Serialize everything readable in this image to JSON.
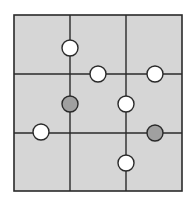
{
  "diagram": {
    "type": "grid-puzzle",
    "rows": 3,
    "cols": 3,
    "colors": {
      "background": "#ffffff",
      "cell_fill": "#d6d6d6",
      "line": "#2a2a2a",
      "white_circle": "#ffffff",
      "gray_circle": "#a0a0a0"
    },
    "frame": {
      "x": 14,
      "y": 15,
      "width": 168,
      "height": 176
    },
    "vertical_lines": [
      {
        "x": 70,
        "y1": 15,
        "y2": 191
      },
      {
        "x": 126,
        "y1": 15,
        "y2": 191
      }
    ],
    "horizontal_lines": [
      {
        "y": 74,
        "x1": 14,
        "x2": 182
      },
      {
        "y": 133,
        "x1": 14,
        "x2": 182
      }
    ],
    "circles": [
      {
        "cx": 70,
        "cy": 48,
        "r": 8,
        "color": "white"
      },
      {
        "cx": 98,
        "cy": 74,
        "r": 8,
        "color": "white"
      },
      {
        "cx": 155,
        "cy": 74,
        "r": 8,
        "color": "white"
      },
      {
        "cx": 70,
        "cy": 104,
        "r": 8,
        "color": "gray"
      },
      {
        "cx": 126,
        "cy": 104,
        "r": 8,
        "color": "white"
      },
      {
        "cx": 41,
        "cy": 132,
        "r": 8,
        "color": "white"
      },
      {
        "cx": 155,
        "cy": 133,
        "r": 8,
        "color": "gray"
      },
      {
        "cx": 126,
        "cy": 163,
        "r": 8,
        "color": "white"
      }
    ]
  }
}
